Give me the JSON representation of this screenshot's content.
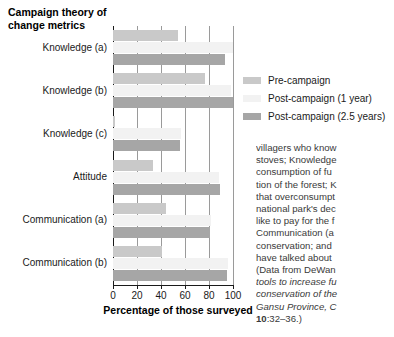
{
  "chart_data": {
    "type": "bar",
    "orientation": "horizontal",
    "title": "Campaign theory of change metrics",
    "xlabel": "Percentage of those surveyed",
    "ylabel": "",
    "xlim": [
      0,
      100
    ],
    "xticks": [
      0,
      20,
      40,
      60,
      80,
      100
    ],
    "xtick_labels": [
      "0",
      "20",
      "40",
      "60",
      "80",
      "100"
    ],
    "grid": true,
    "grid_axis": "x",
    "legend_position": "right",
    "categories": [
      "Knowledge (a)",
      "Knowledge (b)",
      "Knowledge (c)",
      "Attitude",
      "Communication (a)",
      "Communication (b)"
    ],
    "series": [
      {
        "name": "Pre-campaign",
        "color": "#c9c9c9",
        "values": [
          54,
          77,
          2,
          33,
          44,
          41
        ]
      },
      {
        "name": "Post-campaign (1 year)",
        "color": "#f2f2f2",
        "values": [
          100,
          98,
          57,
          88,
          82,
          96
        ]
      },
      {
        "name": "Post-campaign (2.5 years)",
        "color": "#a6a6a6",
        "values": [
          93,
          100,
          56,
          89,
          81,
          95
        ]
      }
    ]
  },
  "legend": {
    "items": [
      {
        "label": "Pre-campaign",
        "color": "#c9c9c9"
      },
      {
        "label": "Post-campaign (1 year)",
        "color": "#f2f2f2"
      },
      {
        "label": "Post-campaign (2.5 years)",
        "color": "#a6a6a6"
      }
    ]
  },
  "caption": {
    "lines": [
      "villagers who know",
      "stoves; Knowledge",
      "consumption of fu",
      "tion of the forest; K",
      "that overconsumpt",
      "national park's dec",
      "like to pay for the f",
      "Communication (a",
      "conservation; and",
      "have talked about"
    ],
    "source_prefix": "(Data from DeWan",
    "italic_lines": [
      "tools to increase fu",
      "conservation of the",
      "Gansu Province, C"
    ],
    "volume": "10",
    "pages": ":32–36.)"
  }
}
